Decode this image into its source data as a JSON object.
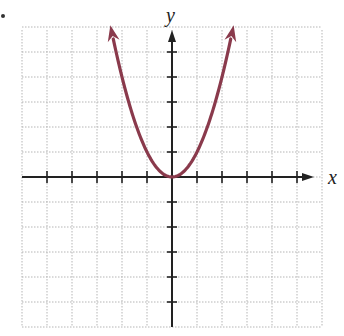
{
  "chart_data": {
    "type": "line",
    "title": "",
    "xlabel": "x",
    "ylabel": "y",
    "function": "y = x^2",
    "grid": true,
    "grid_cell_units": 1,
    "xlim": [
      -6,
      6
    ],
    "ylim": [
      -6,
      6
    ],
    "x_ticks": [
      -5,
      -4,
      -3,
      -2,
      -1,
      1,
      2,
      3,
      4,
      5
    ],
    "y_ticks": [
      -5,
      -4,
      -3,
      -2,
      -1,
      1,
      2,
      3,
      4,
      5
    ],
    "series": [
      {
        "name": "parabola",
        "color": "#8a3a4c",
        "x": [
          -2.5,
          -2,
          -1.5,
          -1,
          -0.5,
          0,
          0.5,
          1,
          1.5,
          2,
          2.5
        ],
        "y": [
          6.25,
          4,
          2.25,
          1,
          0.25,
          0,
          0.25,
          1,
          2.25,
          4,
          6.25
        ],
        "arrows": "both ends"
      }
    ],
    "legend": null
  },
  "labels": {
    "x_axis": "x",
    "y_axis": "y"
  },
  "colors": {
    "curve": "#8a3a4c",
    "axis": "#222222",
    "grid": "#b5b5b5"
  }
}
